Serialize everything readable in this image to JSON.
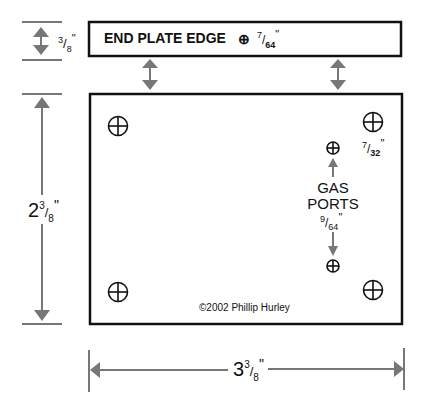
{
  "diagram": {
    "end_plate": {
      "label": "END PLATE EDGE",
      "hole_symbol": "⊕",
      "hole_size_num": "7",
      "hole_size_den": "64",
      "inch": "\""
    },
    "edge_height": {
      "num": "3",
      "den": "8",
      "inch": "\""
    },
    "plate_height": {
      "whole": "2",
      "num": "3",
      "den": "8",
      "inch": "\""
    },
    "plate_width": {
      "whole": "3",
      "num": "3",
      "den": "8",
      "inch": "\""
    },
    "corner_hole": {
      "num": "7",
      "den": "32",
      "inch": "\""
    },
    "gas_ports": {
      "line1": "GAS",
      "line2": "PORTS",
      "num": "9",
      "den": "64",
      "inch": "\""
    },
    "copyright": "©2002 Phillip Hurley"
  },
  "colors": {
    "line": "#111111",
    "arrow": "#777777"
  }
}
